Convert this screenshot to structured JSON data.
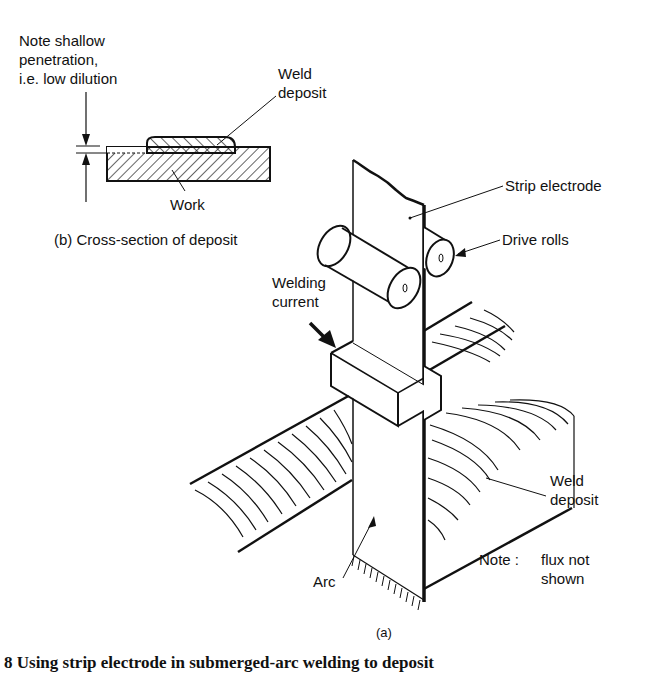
{
  "figure": {
    "inset": {
      "note_line1": "Note shallow",
      "note_line2": "penetration,",
      "note_line3": "i.e. low dilution",
      "weld_deposit_line1": "Weld",
      "weld_deposit_line2": "deposit",
      "work": "Work",
      "caption": "(b)  Cross-section of deposit"
    },
    "main": {
      "strip_electrode": "Strip electrode",
      "drive_rolls": "Drive rolls",
      "welding_current_line1": "Welding",
      "welding_current_line2": "current",
      "weld_deposit_line1": "Weld",
      "weld_deposit_line2": "deposit",
      "arc": "Arc",
      "note_prefix": "Note :",
      "note_line1": "flux not",
      "note_line2": "shown",
      "caption": "(a)"
    },
    "figure_caption_partial": "8  Using strip electrode in submerged-arc welding to deposit"
  }
}
